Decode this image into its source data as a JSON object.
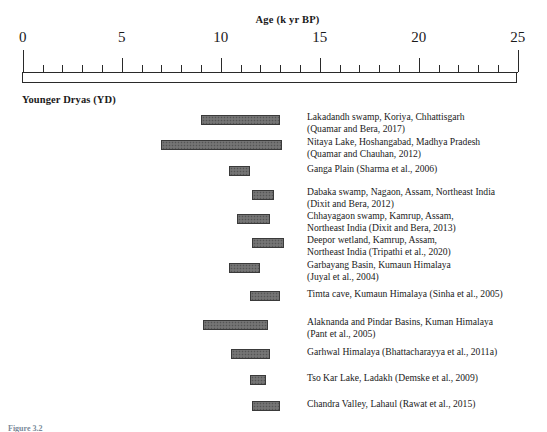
{
  "axis": {
    "title": "Age (k yr BP)",
    "tick_labels": [
      "0",
      "5",
      "10",
      "15",
      "20",
      "25"
    ],
    "tick_values": [
      0,
      5,
      10,
      15,
      20,
      25
    ],
    "minor_interval": 1,
    "range": [
      0,
      25
    ]
  },
  "section_heading": "Younger Dryas (YD)",
  "caption": "Figure 3.2",
  "colors": {
    "bar_fill": "#6e6e6e",
    "bar_border": "#3a3a3a",
    "axis": "#2a2a2a",
    "text": "#1a1a1a"
  },
  "chart_data": {
    "type": "bar",
    "title": "Younger Dryas (YD)",
    "xlabel": "Age (k yr BP)",
    "ylabel": "",
    "xlim": [
      0,
      25
    ],
    "grid": false,
    "legend": "none",
    "orientation": "horizontal-ranges",
    "categories": [
      "Lakadandh swamp, Koriya, Chhattisgarh (Quamar and Bera, 2017)",
      "Nitaya Lake, Hoshangabad, Madhya Pradesh (Quamar and Chauhan, 2012)",
      "Ganga Plain (Sharma et al., 2006)",
      "Dabaka swamp, Nagaon, Assam, Northeast India (Dixit and Bera, 2012)",
      "Chhayagaon swamp, Kamrup, Assam, Northeast India (Dixit and Bera, 2013)",
      "Deepor wetland, Kamrup, Assam, Northeast India (Tripathi et al., 2020)",
      "Garbayang Basin, Kumaun Himalaya (Juyal et al., 2004)",
      "Timta cave, Kumaun Himalaya (Sinha et al., 2005)",
      "Alaknanda and Pindar Basins, Kuman Himalaya (Pant et al., 2005)",
      "Garhwal Himalaya (Bhattacharayya et al., 2011a)",
      "Tso Kar Lake, Ladakh (Demske et al., 2009)",
      "Chandra Valley, Lahaul (Rawat et al., 2015)"
    ],
    "ranges": [
      [
        9.0,
        13.0
      ],
      [
        7.0,
        13.1
      ],
      [
        10.4,
        11.5
      ],
      [
        11.6,
        12.7
      ],
      [
        10.8,
        12.5
      ],
      [
        11.6,
        13.2
      ],
      [
        10.4,
        12.0
      ],
      [
        11.5,
        13.0
      ],
      [
        9.1,
        12.4
      ],
      [
        10.5,
        12.5
      ],
      [
        11.5,
        12.3
      ],
      [
        11.6,
        13.0
      ]
    ]
  },
  "rows": [
    {
      "label": "Lakadandh swamp, Koriya, Chhattisgarh\n(Quamar and Bera, 2017)",
      "start": 9.0,
      "end": 13.0,
      "bar_top": 115,
      "label_top": 111
    },
    {
      "label": "Nitaya Lake, Hoshangabad, Madhya Pradesh\n(Quamar and Chauhan, 2012)",
      "start": 7.0,
      "end": 13.1,
      "bar_top": 140,
      "label_top": 136
    },
    {
      "label": "Ganga Plain (Sharma et al., 2006)",
      "start": 10.4,
      "end": 11.5,
      "bar_top": 166,
      "label_top": 163
    },
    {
      "label": "Dabaka swamp, Nagaon, Assam, Northeast India\n(Dixit and Bera, 2012)",
      "start": 11.6,
      "end": 12.7,
      "bar_top": 190,
      "label_top": 186
    },
    {
      "label": "Chhayagaon swamp, Kamrup, Assam,\nNortheast India (Dixit and Bera, 2013)",
      "start": 10.8,
      "end": 12.5,
      "bar_top": 214,
      "label_top": 210
    },
    {
      "label": "Deepor wetland, Kamrup, Assam,\nNortheast India (Tripathi et al., 2020)",
      "start": 11.6,
      "end": 13.2,
      "bar_top": 238,
      "label_top": 234
    },
    {
      "label": "Garbayang Basin, Kumaun Himalaya\n(Juyal et al., 2004)",
      "start": 10.4,
      "end": 12.0,
      "bar_top": 263,
      "label_top": 259
    },
    {
      "label": "Timta cave, Kumaun Himalaya (Sinha et al., 2005)",
      "start": 11.5,
      "end": 13.0,
      "bar_top": 291,
      "label_top": 288
    },
    {
      "label": "Alaknanda and Pindar Basins, Kuman Himalaya\n(Pant et al., 2005)",
      "start": 9.1,
      "end": 12.4,
      "bar_top": 320,
      "label_top": 316
    },
    {
      "label": "Garhwal Himalaya (Bhattacharayya et al., 2011a)",
      "start": 10.5,
      "end": 12.5,
      "bar_top": 349,
      "label_top": 346
    },
    {
      "label": "Tso Kar Lake, Ladakh (Demske et al., 2009)",
      "start": 11.5,
      "end": 12.3,
      "bar_top": 375,
      "label_top": 372
    },
    {
      "label": "Chandra Valley, Lahaul (Rawat et al., 2015)",
      "start": 11.6,
      "end": 13.0,
      "bar_top": 401,
      "label_top": 398
    }
  ]
}
